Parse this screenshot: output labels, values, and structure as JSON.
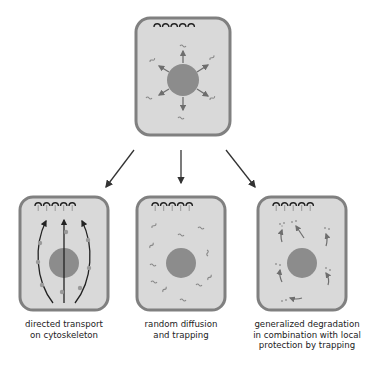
{
  "diagram": {
    "colors": {
      "cell_border": "#7f7f7f",
      "cytoplasm": "#d9d9d9",
      "nucleus": "#8c8c8c",
      "mrna": "#8a8a8a",
      "arrow": "#333333"
    },
    "top_cell": {
      "description": "mRNA exported from nucleus in all directions"
    },
    "panels": [
      {
        "id": "directed-transport",
        "label": "directed transport\non cytoskeleton"
      },
      {
        "id": "random-diffusion",
        "label": "random diffusion\nand trapping"
      },
      {
        "id": "degradation-protection",
        "label": "generalized degradation\nin combination with local\nprotection by trapping"
      }
    ]
  }
}
